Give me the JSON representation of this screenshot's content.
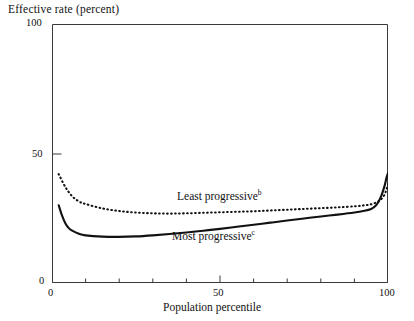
{
  "chart_data": {
    "type": "line",
    "title": "Effective rate (percent)",
    "xlabel": "Population percentile",
    "ylabel": "Effective rate (percent)",
    "xlim": [
      0,
      100
    ],
    "ylim": [
      0,
      100
    ],
    "grid": false,
    "legend_position": "inline-annotations",
    "y_ticks": [
      0,
      50,
      100
    ],
    "y_tick_labels": [
      "0",
      "50",
      "100"
    ],
    "x_ticks": [
      0,
      50,
      100
    ],
    "x_tick_labels": [
      "0",
      "50",
      "100"
    ],
    "x_minor_ticks": [
      10,
      20,
      30,
      40,
      60,
      70,
      80,
      90
    ],
    "series": [
      {
        "name": "Least progressive",
        "footnote_marker": "b",
        "style": "dotted",
        "color": "#111111",
        "x": [
          2,
          4,
          6,
          8,
          10,
          15,
          20,
          25,
          30,
          35,
          40,
          45,
          50,
          55,
          60,
          65,
          70,
          75,
          80,
          85,
          90,
          93,
          95,
          97,
          98,
          99,
          99.5,
          100
        ],
        "values": [
          42,
          37,
          33.5,
          31.5,
          30.5,
          28.8,
          27.8,
          27.2,
          26.9,
          26.8,
          26.9,
          27.1,
          27.3,
          27.5,
          27.7,
          28.0,
          28.3,
          28.6,
          28.9,
          29.2,
          29.6,
          30.0,
          30.4,
          31.4,
          32.4,
          34.2,
          36.0,
          38.0
        ]
      },
      {
        "name": "Most progressive",
        "footnote_marker": "c",
        "style": "solid",
        "color": "#111111",
        "x": [
          2,
          3,
          4,
          5,
          6,
          8,
          10,
          15,
          20,
          25,
          30,
          35,
          40,
          45,
          50,
          55,
          60,
          65,
          70,
          75,
          80,
          85,
          90,
          93,
          95,
          96,
          97,
          98,
          99,
          99.5,
          100
        ],
        "values": [
          30,
          26,
          23,
          21.2,
          20.2,
          19.0,
          18.4,
          17.9,
          17.8,
          18.0,
          18.4,
          18.9,
          19.5,
          20.2,
          20.9,
          21.7,
          22.5,
          23.3,
          24.1,
          24.9,
          25.7,
          26.4,
          27.2,
          27.9,
          28.6,
          29.4,
          31.0,
          33.6,
          37.6,
          40.4,
          42.4
        ]
      }
    ]
  },
  "labels": {
    "axis_title_y": "Effective rate (percent)",
    "axis_title_x": "Population percentile",
    "series_least": "Least progressive",
    "series_least_sup": "b",
    "series_most": "Most progressive",
    "series_most_sup": "c",
    "y_100": "100",
    "y_50": "50",
    "y_0": "0",
    "x_0": "0",
    "x_50": "50",
    "x_100": "100"
  }
}
